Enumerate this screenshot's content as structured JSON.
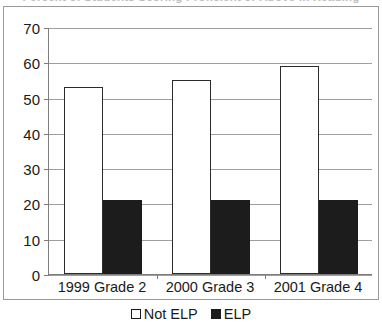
{
  "title_clipped": "Percent of Students Scoring Proficient or Above in Reading",
  "legend": {
    "position": "bottom-center",
    "entries": [
      {
        "label": "Not ELP",
        "marker": "open-square",
        "color": "#ffffff"
      },
      {
        "label": "ELP",
        "marker": "filled-square",
        "color": "#1c1c1c"
      }
    ]
  },
  "axis": {
    "y_ticks": [
      "0",
      "10",
      "20",
      "30",
      "40",
      "50",
      "60",
      "70"
    ]
  },
  "chart_data": {
    "type": "bar",
    "title": "Percent of Students Scoring Proficient or Above in Reading",
    "xlabel": "",
    "ylabel": "",
    "ylim": [
      0,
      70
    ],
    "ytick_step": 10,
    "grid": true,
    "legend_position": "bottom-center",
    "categories": [
      "1999 Grade 2",
      "2000 Grade 3",
      "2001 Grade 4"
    ],
    "series": [
      {
        "name": "Not ELP",
        "values": [
          53,
          55,
          59
        ],
        "color": "#ffffff"
      },
      {
        "name": "ELP",
        "values": [
          21,
          21,
          21
        ],
        "color": "#1c1c1c"
      }
    ]
  }
}
